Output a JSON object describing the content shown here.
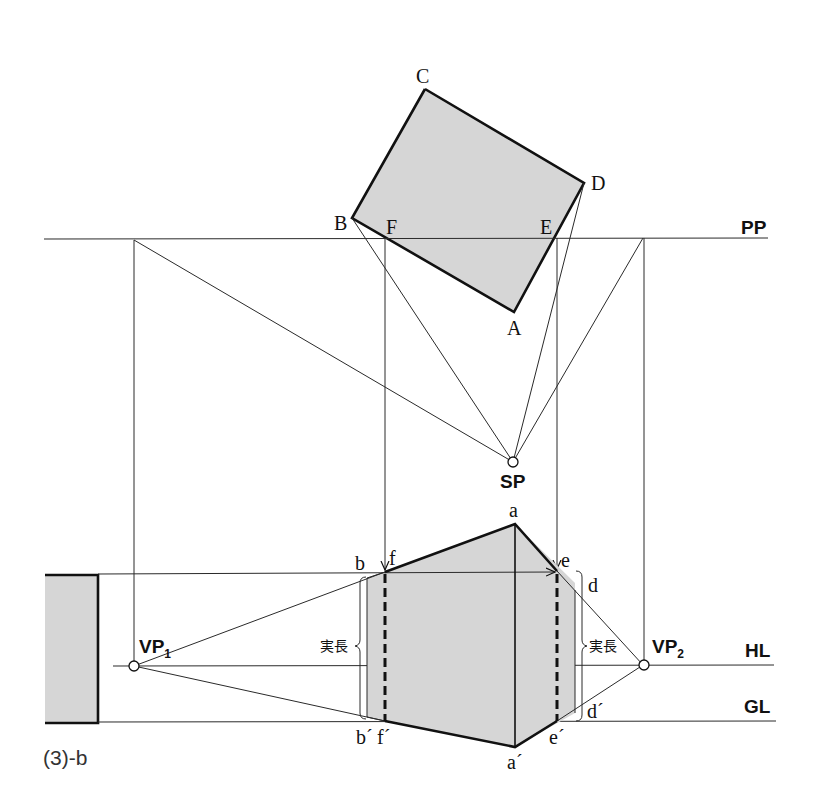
{
  "colors": {
    "fill": "#d6d6d6",
    "line": "#1a1a1a",
    "background": "#ffffff"
  },
  "caption": "(3)-b",
  "plan": {
    "corners": {
      "A": "A",
      "B": "B",
      "C": "C",
      "D": "D"
    },
    "intersections": {
      "E": "E",
      "F": "F"
    },
    "station_point": "SP"
  },
  "lines": {
    "picture_plane": "PP",
    "horizon_line": "HL",
    "ground_line": "GL"
  },
  "vanishing_points": {
    "vp1": {
      "base": "VP",
      "sub": "1"
    },
    "vp2": {
      "base": "VP",
      "sub": "2"
    }
  },
  "elevation": {
    "top_points": {
      "a": "a",
      "b": "b",
      "d": "d",
      "e": "e",
      "f": "f"
    },
    "bottom_points": {
      "a": "a´",
      "b": "b´",
      "d": "d´",
      "e": "e´",
      "f": "f´"
    },
    "true_length_left": "実長",
    "true_length_right": "実長"
  }
}
